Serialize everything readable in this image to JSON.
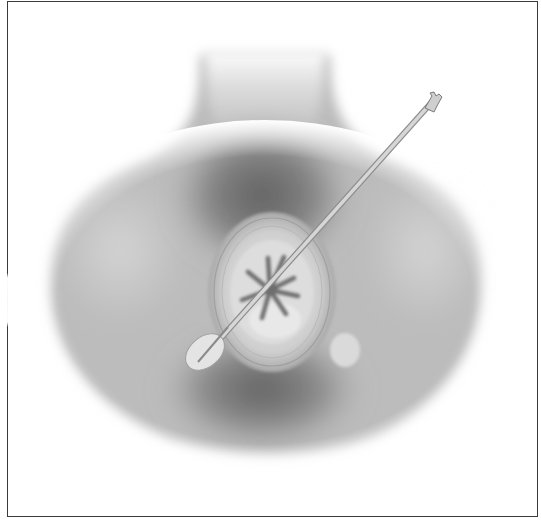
{
  "figure": {
    "type": "medical-illustration",
    "style": "grayscale airbrush",
    "colors": {
      "border": "#3a3a3a",
      "background": "#ffffff",
      "skin_light": "#d8d8d8",
      "skin_mid": "#b4b4b4",
      "shadow_dark": "#6a6a6a",
      "instrument": "#c8c8c8"
    }
  }
}
